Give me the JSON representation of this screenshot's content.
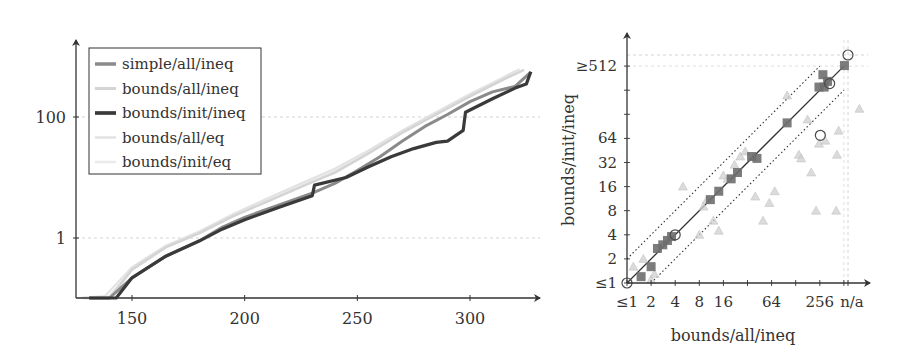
{
  "chart_data": [
    {
      "type": "line",
      "title": "",
      "xlabel": "",
      "ylabel": "",
      "yscale": "log",
      "xlim": [
        125,
        335
      ],
      "x_ticks": [
        150,
        200,
        250,
        300
      ],
      "y_ticks": [
        {
          "value": 1,
          "label": "1"
        },
        {
          "value": 100,
          "label": "100"
        }
      ],
      "grid": "horizontal dashed at y ticks",
      "legend_position": "upper left",
      "series": [
        {
          "name": "simple/all/ineq",
          "color": "#8a8a8a",
          "width": 3,
          "points": [
            [
              131,
              0.05
            ],
            [
              140,
              0.07
            ],
            [
              150,
              0.22
            ],
            [
              165,
              0.5
            ],
            [
              180,
              0.9
            ],
            [
              190,
              1.5
            ],
            [
              200,
              2.2
            ],
            [
              215,
              3.5
            ],
            [
              230,
              5.5
            ],
            [
              240,
              8
            ],
            [
              250,
              13
            ],
            [
              260,
              22
            ],
            [
              270,
              40
            ],
            [
              280,
              70
            ],
            [
              290,
              110
            ],
            [
              300,
              180
            ],
            [
              310,
              260
            ],
            [
              320,
              320
            ],
            [
              327,
              550
            ]
          ]
        },
        {
          "name": "bounds/all/ineq",
          "color": "#d4d4d4",
          "width": 2.5,
          "points": [
            [
              128,
              0.05
            ],
            [
              140,
              0.1
            ],
            [
              150,
              0.3
            ],
            [
              165,
              0.7
            ],
            [
              180,
              1.2
            ],
            [
              195,
              2.3
            ],
            [
              210,
              4
            ],
            [
              225,
              7
            ],
            [
              240,
              12
            ],
            [
              255,
              25
            ],
            [
              270,
              55
            ],
            [
              285,
              110
            ],
            [
              300,
              220
            ],
            [
              315,
              420
            ],
            [
              324,
              600
            ]
          ]
        },
        {
          "name": "bounds/init/ineq",
          "color": "#3a3a3a",
          "width": 3.2,
          "points": [
            [
              131,
              0.05
            ],
            [
              143,
              0.07
            ],
            [
              150,
              0.22
            ],
            [
              165,
              0.5
            ],
            [
              180,
              0.9
            ],
            [
              190,
              1.4
            ],
            [
              200,
              2
            ],
            [
              215,
              3.2
            ],
            [
              230,
              5
            ],
            [
              231,
              7.5
            ],
            [
              245,
              10
            ],
            [
              255,
              15
            ],
            [
              265,
              22
            ],
            [
              275,
              30
            ],
            [
              285,
              38
            ],
            [
              290,
              40
            ],
            [
              297,
              60
            ],
            [
              298,
              120
            ],
            [
              310,
              200
            ],
            [
              320,
              300
            ],
            [
              325,
              350
            ],
            [
              327,
              560
            ]
          ]
        },
        {
          "name": "bounds/all/eq",
          "color": "#e2e2e2",
          "width": 2,
          "points": [
            [
              126,
              0.05
            ],
            [
              138,
              0.11
            ],
            [
              150,
              0.33
            ],
            [
              165,
              0.75
            ],
            [
              180,
              1.3
            ],
            [
              195,
              2.5
            ],
            [
              210,
              4.5
            ],
            [
              225,
              8
            ],
            [
              240,
              14
            ],
            [
              255,
              28
            ],
            [
              270,
              60
            ],
            [
              285,
              120
            ],
            [
              300,
              240
            ],
            [
              315,
              450
            ],
            [
              322,
              620
            ]
          ]
        },
        {
          "name": "bounds/init/eq",
          "color": "#ebebeb",
          "width": 2,
          "points": [
            [
              127,
              0.05
            ],
            [
              139,
              0.1
            ],
            [
              150,
              0.3
            ],
            [
              165,
              0.72
            ],
            [
              180,
              1.25
            ],
            [
              195,
              2.4
            ],
            [
              210,
              4.2
            ],
            [
              225,
              7.5
            ],
            [
              240,
              13
            ],
            [
              255,
              26
            ],
            [
              270,
              58
            ],
            [
              285,
              115
            ],
            [
              300,
              230
            ],
            [
              312,
              400
            ],
            [
              320,
              580
            ]
          ]
        }
      ]
    },
    {
      "type": "scatter",
      "title": "",
      "xlabel": "bounds/all/ineq",
      "ylabel": "bounds/init/ineq",
      "xscale": "log2",
      "yscale": "log2",
      "x_ticks": [
        "≤1",
        "2",
        "4",
        "8",
        "16",
        "64",
        "256",
        "n/a"
      ],
      "y_ticks": [
        "≤1",
        "2",
        "4",
        "8",
        "16",
        "32",
        "64",
        "≥512"
      ],
      "reference_lines": [
        "y = x (solid)",
        "y = 2x (dotted)",
        "y = x/2 (dotted)",
        "x = n/a (dashed)",
        "y = n/a (dashed)"
      ],
      "series": [
        {
          "name": "squares",
          "marker": "square",
          "color": "#6e6e6e",
          "points": [
            [
              1.5,
              1.2
            ],
            [
              2,
              1.6
            ],
            [
              2.4,
              2.7
            ],
            [
              2.8,
              3
            ],
            [
              3.2,
              3.4
            ],
            [
              3.6,
              3.8
            ],
            [
              11,
              11
            ],
            [
              14,
              14
            ],
            [
              20,
              20
            ],
            [
              24,
              24
            ],
            [
              36,
              38
            ],
            [
              42,
              36
            ],
            [
              100,
              100
            ],
            [
              250,
              280
            ],
            [
              280,
              400
            ],
            [
              290,
              280
            ],
            [
              320,
              330
            ],
            [
              520,
              520
            ]
          ]
        },
        {
          "name": "triangles",
          "marker": "triangle",
          "color": "#cfcfcf",
          "points": [
            [
              1.2,
              1.6
            ],
            [
              1.6,
              2
            ],
            [
              2,
              1.1
            ],
            [
              2.2,
              1.3
            ],
            [
              5,
              16
            ],
            [
              8,
              4
            ],
            [
              9,
              9
            ],
            [
              10,
              11
            ],
            [
              12,
              6
            ],
            [
              14,
              4.5
            ],
            [
              16,
              22
            ],
            [
              18,
              20
            ],
            [
              22,
              30
            ],
            [
              26,
              38
            ],
            [
              30,
              44
            ],
            [
              40,
              12
            ],
            [
              50,
              6
            ],
            [
              60,
              10
            ],
            [
              70,
              14
            ],
            [
              100,
              220
            ],
            [
              140,
              40
            ],
            [
              150,
              36
            ],
            [
              180,
              110
            ],
            [
              200,
              24
            ],
            [
              230,
              8
            ],
            [
              250,
              55
            ],
            [
              300,
              60
            ],
            [
              410,
              8
            ],
            [
              420,
              40
            ],
            [
              440,
              80
            ],
            [
              800,
              150
            ]
          ]
        },
        {
          "name": "circles",
          "marker": "circle",
          "color": "#4a4a4a",
          "points": [
            [
              1,
              1
            ],
            [
              4,
              4
            ],
            [
              260,
              70
            ],
            [
              340,
              310
            ],
            [
              "n/a",
              "n/a"
            ]
          ]
        }
      ]
    }
  ]
}
